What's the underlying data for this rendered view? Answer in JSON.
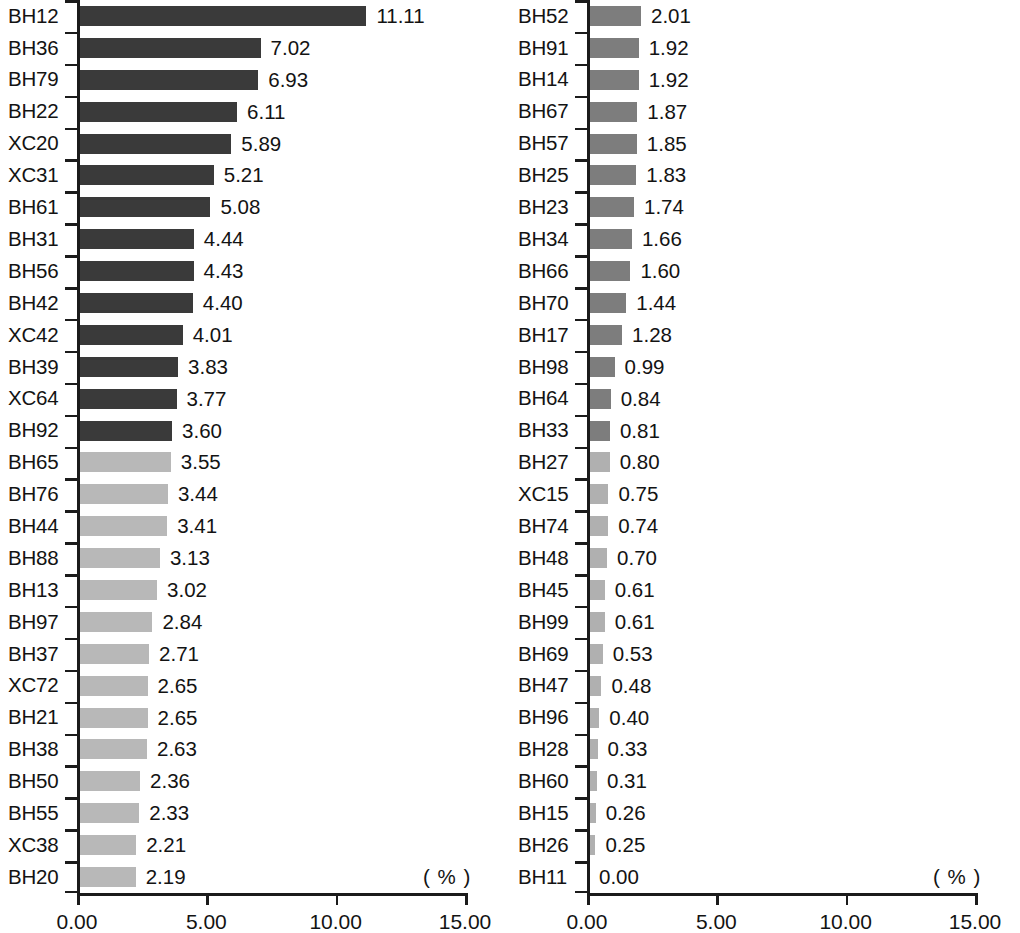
{
  "figure": {
    "background_color": "#ffffff",
    "axis_color": "#1b1b1b",
    "text_color": "#131313"
  },
  "chart_data": [
    {
      "type": "bar",
      "orientation": "horizontal",
      "panel": "left",
      "title": "",
      "xlabel": "( % )",
      "ylabel": "",
      "xlim": [
        0.0,
        15.0
      ],
      "xticks": [
        "0.00",
        "5.00",
        "10.00",
        "15.00"
      ],
      "xtick_values": [
        0.0,
        5.0,
        10.0,
        15.0
      ],
      "grid": false,
      "legend": "none",
      "unit_label": "( % )",
      "categories": [
        "BH12",
        "BH36",
        "BH79",
        "BH22",
        "XC20",
        "XC31",
        "BH61",
        "BH31",
        "BH56",
        "BH42",
        "XC42",
        "BH39",
        "XC64",
        "BH92",
        "BH65",
        "BH76",
        "BH44",
        "BH88",
        "BH13",
        "BH97",
        "BH37",
        "XC72",
        "BH21",
        "BH38",
        "BH50",
        "BH55",
        "XC38",
        "BH20"
      ],
      "values": [
        11.11,
        7.02,
        6.93,
        6.11,
        5.89,
        5.21,
        5.08,
        4.44,
        4.43,
        4.4,
        4.01,
        3.83,
        3.77,
        3.6,
        3.55,
        3.44,
        3.41,
        3.13,
        3.02,
        2.84,
        2.71,
        2.65,
        2.65,
        2.63,
        2.36,
        2.33,
        2.21,
        2.19
      ],
      "value_labels": [
        "11.11",
        "7.02",
        "6.93",
        "6.11",
        "5.89",
        "5.21",
        "5.08",
        "4.44",
        "4.43",
        "4.40",
        "4.01",
        "3.83",
        "3.77",
        "3.60",
        "3.55",
        "3.44",
        "3.41",
        "3.13",
        "3.02",
        "2.84",
        "2.71",
        "2.65",
        "2.65",
        "2.63",
        "2.36",
        "2.33",
        "2.21",
        "2.19"
      ],
      "bar_colors": [
        "#3a3a3a",
        "#3a3a3a",
        "#3a3a3a",
        "#3a3a3a",
        "#3a3a3a",
        "#3a3a3a",
        "#3a3a3a",
        "#3a3a3a",
        "#3a3a3a",
        "#3a3a3a",
        "#3a3a3a",
        "#3a3a3a",
        "#3a3a3a",
        "#3a3a3a",
        "#b8b8b8",
        "#b8b8b8",
        "#b8b8b8",
        "#b8b8b8",
        "#b8b8b8",
        "#b8b8b8",
        "#b8b8b8",
        "#b8b8b8",
        "#b8b8b8",
        "#b8b8b8",
        "#b8b8b8",
        "#b8b8b8",
        "#b8b8b8",
        "#b8b8b8"
      ]
    },
    {
      "type": "bar",
      "orientation": "horizontal",
      "panel": "right",
      "title": "",
      "xlabel": "( % )",
      "ylabel": "",
      "xlim": [
        0.0,
        15.0
      ],
      "xticks": [
        "0.00",
        "5.00",
        "10.00",
        "15.00"
      ],
      "xtick_values": [
        0.0,
        5.0,
        10.0,
        15.0
      ],
      "grid": false,
      "legend": "none",
      "unit_label": "( % )",
      "categories": [
        "BH52",
        "BH91",
        "BH14",
        "BH67",
        "BH57",
        "BH25",
        "BH23",
        "BH34",
        "BH66",
        "BH70",
        "BH17",
        "BH98",
        "BH64",
        "BH33",
        "BH27",
        "XC15",
        "BH74",
        "BH48",
        "BH45",
        "BH99",
        "BH69",
        "BH47",
        "BH96",
        "BH28",
        "BH60",
        "BH15",
        "BH26",
        "BH11"
      ],
      "values": [
        2.01,
        1.92,
        1.92,
        1.87,
        1.85,
        1.83,
        1.74,
        1.66,
        1.6,
        1.44,
        1.28,
        0.99,
        0.84,
        0.81,
        0.8,
        0.75,
        0.74,
        0.7,
        0.61,
        0.61,
        0.53,
        0.48,
        0.4,
        0.33,
        0.31,
        0.26,
        0.25,
        0.0
      ],
      "value_labels": [
        "2.01",
        "1.92",
        "1.92",
        "1.87",
        "1.85",
        "1.83",
        "1.74",
        "1.66",
        "1.60",
        "1.44",
        "1.28",
        "0.99",
        "0.84",
        "0.81",
        "0.80",
        "0.75",
        "0.74",
        "0.70",
        "0.61",
        "0.61",
        "0.53",
        "0.48",
        "0.40",
        "0.33",
        "0.31",
        "0.26",
        "0.25",
        "0.00"
      ],
      "bar_colors": [
        "#7d7d7d",
        "#7d7d7d",
        "#7d7d7d",
        "#7d7d7d",
        "#7d7d7d",
        "#7d7d7d",
        "#7d7d7d",
        "#7d7d7d",
        "#7d7d7d",
        "#7d7d7d",
        "#7d7d7d",
        "#7d7d7d",
        "#7d7d7d",
        "#7d7d7d",
        "#b0b0b0",
        "#b0b0b0",
        "#b0b0b0",
        "#b0b0b0",
        "#b0b0b0",
        "#b0b0b0",
        "#b0b0b0",
        "#b0b0b0",
        "#b0b0b0",
        "#b0b0b0",
        "#b0b0b0",
        "#b0b0b0",
        "#b0b0b0",
        "#b0b0b0"
      ]
    }
  ]
}
